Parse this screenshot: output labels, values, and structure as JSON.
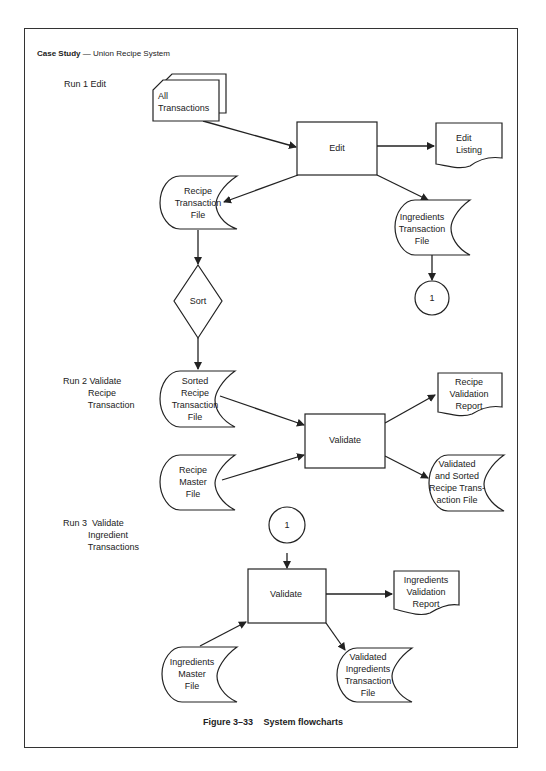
{
  "header": {
    "title_bold": "Case Study",
    "dash": "—",
    "title_rest": "Union Recipe System"
  },
  "runs": [
    {
      "id": "run1",
      "label": "Run 1 Edit"
    },
    {
      "id": "run2",
      "label": "Run 2 Validate\n          Recipe\n          Transaction"
    },
    {
      "id": "run3",
      "label": "Run 3  Validate\n          Ingredient\n          Transactions"
    }
  ],
  "nodes": {
    "all_transactions": {
      "type": "punched-cards",
      "lines": [
        "All",
        "Transactions"
      ]
    },
    "edit": {
      "type": "process",
      "lines": [
        "Edit"
      ]
    },
    "edit_listing": {
      "type": "document",
      "lines": [
        "Edit",
        "Listing"
      ]
    },
    "recipe_transaction_file": {
      "type": "stored-data",
      "lines": [
        "Recipe",
        "Transaction",
        "File"
      ]
    },
    "ingredients_transaction_file": {
      "type": "stored-data",
      "lines": [
        "Ingredients",
        "Transaction",
        "File"
      ]
    },
    "connector_1_out": {
      "type": "connector",
      "lines": [
        "1"
      ]
    },
    "sort": {
      "type": "decision",
      "lines": [
        "Sort"
      ]
    },
    "sorted_recipe_transaction_file": {
      "type": "stored-data",
      "lines": [
        "Sorted",
        "Recipe",
        "Transaction",
        "File"
      ]
    },
    "recipe_master_file": {
      "type": "stored-data",
      "lines": [
        "Recipe",
        "Master",
        "File"
      ]
    },
    "validate_recipe": {
      "type": "process",
      "lines": [
        "Validate"
      ]
    },
    "recipe_validation_report": {
      "type": "document",
      "lines": [
        "Recipe",
        "Validation",
        "Report"
      ]
    },
    "validated_sorted_recipe_file": {
      "type": "stored-data",
      "lines": [
        "Validated",
        "and Sorted",
        "Recipe Trans-",
        "action File"
      ]
    },
    "connector_1_in": {
      "type": "connector",
      "lines": [
        "1"
      ]
    },
    "validate_ingredients": {
      "type": "process",
      "lines": [
        "Validate"
      ]
    },
    "ingredients_validation_report": {
      "type": "document",
      "lines": [
        "Ingredients",
        "Validation",
        "Report"
      ]
    },
    "ingredients_master_file": {
      "type": "stored-data",
      "lines": [
        "Ingredients",
        "Master",
        "File"
      ]
    },
    "validated_ingredients_transaction_file": {
      "type": "stored-data",
      "lines": [
        "Validated",
        "Ingredients",
        "Transaction",
        "File"
      ]
    }
  },
  "edges": [
    {
      "from": "all_transactions",
      "to": "edit"
    },
    {
      "from": "edit",
      "to": "edit_listing"
    },
    {
      "from": "edit",
      "to": "recipe_transaction_file"
    },
    {
      "from": "edit",
      "to": "ingredients_transaction_file"
    },
    {
      "from": "ingredients_transaction_file",
      "to": "connector_1_out"
    },
    {
      "from": "recipe_transaction_file",
      "to": "sort"
    },
    {
      "from": "sort",
      "to": "sorted_recipe_transaction_file"
    },
    {
      "from": "sorted_recipe_transaction_file",
      "to": "validate_recipe"
    },
    {
      "from": "recipe_master_file",
      "to": "validate_recipe"
    },
    {
      "from": "validate_recipe",
      "to": "recipe_validation_report"
    },
    {
      "from": "validate_recipe",
      "to": "validated_sorted_recipe_file"
    },
    {
      "from": "connector_1_in",
      "to": "validate_ingredients"
    },
    {
      "from": "validate_ingredients",
      "to": "ingredients_validation_report"
    },
    {
      "from": "ingredients_master_file",
      "to": "validate_ingredients"
    },
    {
      "from": "validate_ingredients",
      "to": "validated_ingredients_transaction_file"
    }
  ],
  "caption": {
    "figure": "Figure 3–33",
    "title": "System flowcharts"
  }
}
